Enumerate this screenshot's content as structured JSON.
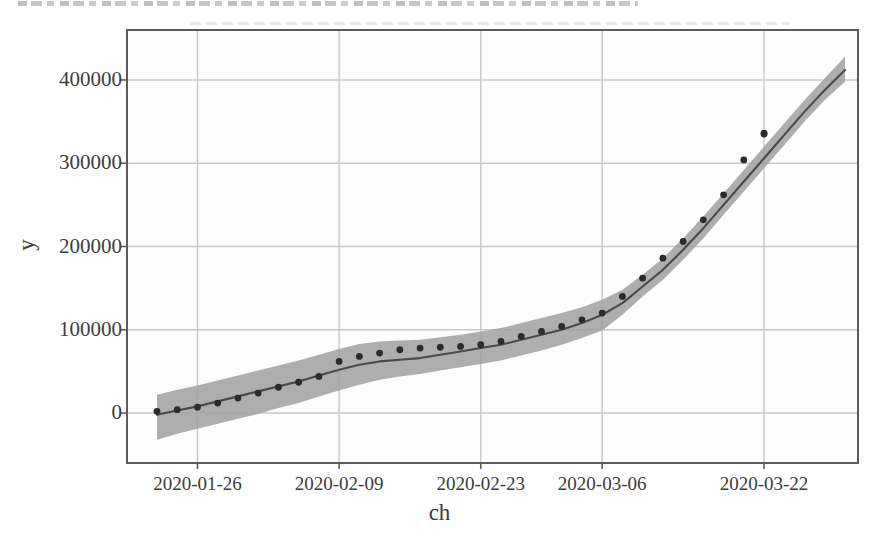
{
  "figure": {
    "x_axis_label": "ch",
    "y_axis_label": "y",
    "scan_artifact_top": "cut-off-text-strip"
  },
  "chart_data": {
    "type": "line",
    "title": "",
    "xlabel": "ch",
    "ylabel": "y",
    "grid": true,
    "legend": null,
    "xtick_labels": [
      "2020-01-26",
      "2020-02-09",
      "2020-02-23",
      "2020-03-06",
      "2020-03-22"
    ],
    "ytick_labels": [
      "0",
      "100000",
      "200000",
      "300000",
      "400000"
    ],
    "ytick_values": [
      0,
      100000,
      200000,
      300000,
      400000
    ],
    "ylim": [
      -60000,
      460000
    ],
    "xlim": [
      "2020-01-20",
      "2020-03-31"
    ],
    "series": [
      {
        "name": "fit",
        "style": "line",
        "color": "#4a4a4a",
        "x": [
          "2020-01-22",
          "2020-01-24",
          "2020-01-26",
          "2020-01-28",
          "2020-01-30",
          "2020-02-01",
          "2020-02-03",
          "2020-02-05",
          "2020-02-07",
          "2020-02-09",
          "2020-02-11",
          "2020-02-13",
          "2020-02-15",
          "2020-02-17",
          "2020-02-19",
          "2020-02-21",
          "2020-02-23",
          "2020-02-25",
          "2020-02-27",
          "2020-02-29",
          "2020-03-02",
          "2020-03-04",
          "2020-03-06",
          "2020-03-08",
          "2020-03-10",
          "2020-03-12",
          "2020-03-14",
          "2020-03-16",
          "2020-03-18",
          "2020-03-20",
          "2020-03-22",
          "2020-03-24",
          "2020-03-26",
          "2020-03-28",
          "2020-03-30"
        ],
        "values": [
          -2000,
          3000,
          8000,
          14000,
          20000,
          26000,
          32000,
          38000,
          45000,
          52000,
          58000,
          62000,
          64000,
          66000,
          70000,
          74000,
          78000,
          82000,
          88000,
          94000,
          100000,
          108000,
          118000,
          132000,
          152000,
          172000,
          196000,
          222000,
          250000,
          278000,
          306000,
          334000,
          362000,
          388000,
          412000
        ]
      },
      {
        "name": "observed",
        "style": "scatter",
        "color": "#2b2b2b",
        "x": [
          "2020-01-22",
          "2020-01-24",
          "2020-01-26",
          "2020-01-28",
          "2020-01-30",
          "2020-02-01",
          "2020-02-03",
          "2020-02-05",
          "2020-02-07",
          "2020-02-09",
          "2020-02-11",
          "2020-02-13",
          "2020-02-15",
          "2020-02-17",
          "2020-02-19",
          "2020-02-21",
          "2020-02-23",
          "2020-02-25",
          "2020-02-27",
          "2020-02-29",
          "2020-03-02",
          "2020-03-04",
          "2020-03-06",
          "2020-03-08",
          "2020-03-10",
          "2020-03-12",
          "2020-03-14",
          "2020-03-16",
          "2020-03-18",
          "2020-03-20",
          "2020-03-21",
          "2020-03-22"
        ],
        "values": [
          2000,
          4000,
          7000,
          12000,
          18000,
          24000,
          31000,
          37000,
          44000,
          62000,
          68000,
          72000,
          76000,
          78000,
          79000,
          80000,
          82000,
          86000,
          92000,
          98000,
          104000,
          112000,
          120000,
          140000,
          162000,
          186000,
          206000,
          232000,
          262000,
          304000,
          335000,
          336000
        ]
      }
    ],
    "confidence_band": {
      "name": "confidence-interval",
      "color": "#a0a0a0",
      "opacity": 0.85,
      "lower": [
        -32000,
        -25000,
        -19000,
        -13000,
        -7000,
        -1000,
        6000,
        12000,
        20000,
        27000,
        34000,
        40000,
        44000,
        47000,
        51000,
        55000,
        59000,
        63000,
        69000,
        75000,
        82000,
        90000,
        99000,
        118000,
        140000,
        160000,
        184000,
        210000,
        238000,
        266000,
        294000,
        322000,
        350000,
        376000,
        398000
      ],
      "upper": [
        22000,
        28000,
        33000,
        39000,
        45000,
        51000,
        57000,
        63000,
        70000,
        77000,
        83000,
        86000,
        87000,
        88000,
        91000,
        94000,
        98000,
        102000,
        108000,
        114000,
        120000,
        127000,
        136000,
        148000,
        166000,
        186000,
        210000,
        236000,
        264000,
        292000,
        320000,
        348000,
        376000,
        402000,
        428000
      ]
    }
  }
}
